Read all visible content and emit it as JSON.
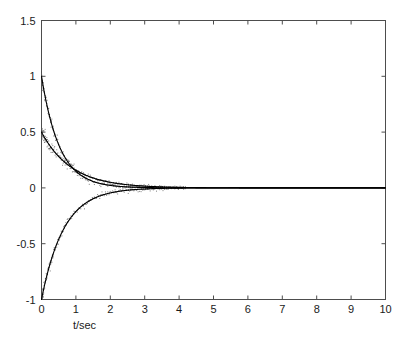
{
  "chart_data": {
    "type": "line",
    "title": "",
    "subtitle": "",
    "xlabel": "t/sec",
    "ylabel": "",
    "xlim": [
      0,
      10
    ],
    "ylim": [
      -1,
      1.5
    ],
    "grid": false,
    "legend": "none",
    "box": true,
    "xticks": [
      0,
      1,
      2,
      3,
      4,
      5,
      6,
      7,
      8,
      9,
      10
    ],
    "xtick_labels": [
      "0",
      "1",
      "2",
      "3",
      "4",
      "5",
      "6",
      "7",
      "8",
      "9",
      "10"
    ],
    "yticks": [
      -1,
      -0.5,
      0,
      0.5,
      1,
      1.5
    ],
    "ytick_labels": [
      "-1",
      "-0.5",
      "0",
      "0.5",
      "1",
      "1.5"
    ],
    "line_color": "#000000",
    "scatter_color": "#555555",
    "axis_color": "#4d4d4d",
    "background": "#ffffff",
    "series": [
      {
        "name": "decay-from-one",
        "style": "solid-with-dots",
        "amplitude": 1.0,
        "decay_rate": 1.9,
        "x": [
          0,
          0.1,
          0.2,
          0.3,
          0.4,
          0.5,
          0.6,
          0.7,
          0.8,
          0.9,
          1.0,
          1.2,
          1.4,
          1.6,
          1.8,
          2.0,
          2.5,
          3.0,
          4.0,
          5.0,
          6.0,
          8.0,
          10.0
        ],
        "values": [
          1.0,
          0.827,
          0.684,
          0.566,
          0.468,
          0.387,
          0.32,
          0.265,
          0.219,
          0.181,
          0.15,
          0.102,
          0.07,
          0.048,
          0.033,
          0.022,
          0.009,
          0.003,
          0.0005,
          0.0001,
          0.0,
          0.0,
          0.0
        ]
      },
      {
        "name": "decay-from-half",
        "style": "solid-with-dots",
        "amplitude": 0.5,
        "decay_rate": 1.15,
        "x": [
          0,
          0.1,
          0.2,
          0.3,
          0.4,
          0.5,
          0.6,
          0.7,
          0.8,
          0.9,
          1.0,
          1.2,
          1.4,
          1.6,
          1.8,
          2.0,
          2.5,
          3.0,
          4.0,
          5.0,
          6.0,
          8.0,
          10.0
        ],
        "values": [
          0.5,
          0.446,
          0.397,
          0.354,
          0.316,
          0.281,
          0.251,
          0.224,
          0.199,
          0.178,
          0.158,
          0.126,
          0.1,
          0.079,
          0.063,
          0.05,
          0.028,
          0.016,
          0.005,
          0.0016,
          0.0005,
          0.0,
          0.0
        ]
      },
      {
        "name": "rise-from-negative-one",
        "style": "solid-with-dots",
        "amplitude": -1.0,
        "decay_rate": 1.55,
        "x": [
          0,
          0.1,
          0.2,
          0.3,
          0.4,
          0.5,
          0.6,
          0.7,
          0.8,
          0.9,
          1.0,
          1.2,
          1.4,
          1.6,
          1.8,
          2.0,
          2.5,
          3.0,
          4.0,
          5.0,
          6.0,
          8.0,
          10.0
        ],
        "values": [
          -1.0,
          -0.856,
          -0.733,
          -0.628,
          -0.538,
          -0.461,
          -0.394,
          -0.338,
          -0.289,
          -0.248,
          -0.212,
          -0.156,
          -0.114,
          -0.084,
          -0.062,
          -0.045,
          -0.021,
          -0.0095,
          -0.002,
          -0.0004,
          -0.0001,
          0.0,
          0.0
        ]
      }
    ],
    "noise": {
      "present": true,
      "description": "dotted scatter cloud around each curve, densest near t<2, vanishing after t~3",
      "spread": 0.045
    }
  }
}
